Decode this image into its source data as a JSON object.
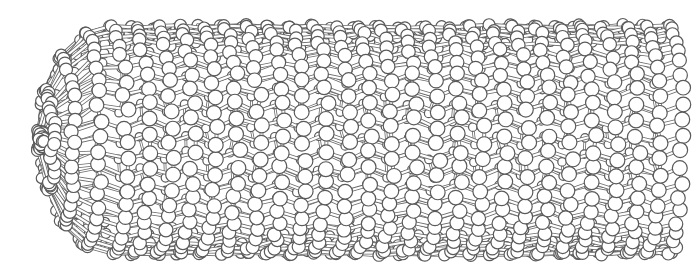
{
  "figure": {
    "width": 700,
    "height": 274,
    "background": "#ffffff",
    "atom_fill": "#ffffff",
    "atom_stroke": "#5a5a5a",
    "bond_stroke": "#6a6a6a",
    "bond_fill": "#ffffff"
  },
  "tube": {
    "x_start": 112,
    "x_end": 668,
    "center_y": 140,
    "radius": 120,
    "cap_radius_x": 72,
    "rings_around": 22,
    "rings_along": 26,
    "atom_radius_front": 7.5,
    "atom_radius_back": 4.2,
    "tilt": 0.12
  }
}
